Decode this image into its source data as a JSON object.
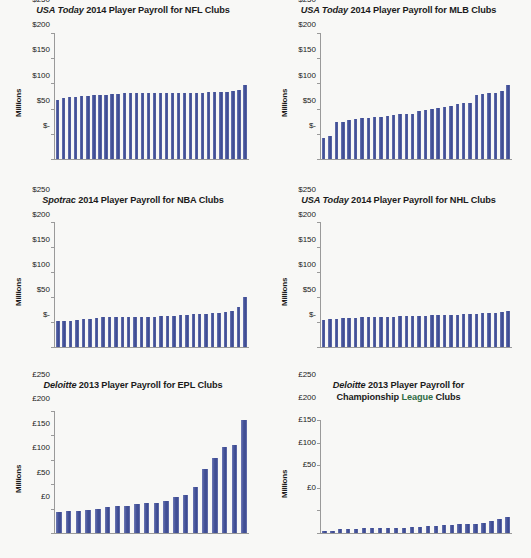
{
  "page": {
    "background": "#f8f8f6",
    "bar_color": "#4c5a9b",
    "axis_color": "#9a9a9a"
  },
  "axis_label": "Millions",
  "charts": [
    {
      "id": "nfl",
      "title_source": "USA Today",
      "title_rest": " 2014 Player Payroll for NFL Clubs",
      "title_full": "USA Today 2014 Player Payroll for NFL Clubs",
      "currency": "$",
      "ylabel": "Millions",
      "yticks": [
        "$250",
        "$200",
        "$150",
        "$100",
        "$50",
        "$-"
      ],
      "ytick_values": [
        250,
        200,
        150,
        100,
        50,
        0
      ]
    },
    {
      "id": "mlb",
      "title_source": "USA Today",
      "title_rest": " 2014 Player Payroll for MLB Clubs",
      "title_full": "USA Today 2014 Player Payroll for MLB Clubs",
      "currency": "$",
      "ylabel": "Millions",
      "yticks": [
        "$250",
        "$200",
        "$150",
        "$100",
        "$50",
        "$-"
      ],
      "ytick_values": [
        250,
        200,
        150,
        100,
        50,
        0
      ]
    },
    {
      "id": "nba",
      "title_source": "Spotrac",
      "title_rest": " 2014 Player Payroll for NBA Clubs",
      "title_full": "Spotrac 2014 Player Payroll for NBA Clubs",
      "currency": "$",
      "ylabel": "Millions",
      "yticks": [
        "$250",
        "$200",
        "$150",
        "$100",
        "$50",
        "$-"
      ],
      "ytick_values": [
        250,
        200,
        150,
        100,
        50,
        0
      ]
    },
    {
      "id": "nhl",
      "title_source": "USA Today",
      "title_rest": " 2014 Player Payroll for NHL Clubs",
      "title_full": "USA Today 2014 Player Payroll for NHL Clubs",
      "currency": "$",
      "ylabel": "Millions",
      "yticks": [
        "$250",
        "$200",
        "$150",
        "$100",
        "$50",
        "$-"
      ],
      "ytick_values": [
        250,
        200,
        150,
        100,
        50,
        0
      ]
    },
    {
      "id": "epl",
      "title_source": "Deloitte",
      "title_rest": " 2013 Player Payroll for EPL Clubs",
      "title_full": "Deloitte 2013 Player Payroll for EPL Clubs",
      "currency": "£",
      "ylabel": "Millions",
      "yticks": [
        "£250",
        "£200",
        "£150",
        "£100",
        "£50",
        "£0"
      ],
      "ytick_values": [
        250,
        200,
        150,
        100,
        50,
        0
      ]
    },
    {
      "id": "championship",
      "title_source": "Deloitte",
      "title_rest": " 2013 Player Payroll for",
      "title_line2_a": "Championship ",
      "title_line2_green": "League",
      "title_line2_b": " Clubs",
      "title_full": "Deloitte 2013 Player Payroll for Championship League Clubs",
      "currency": "£",
      "ylabel": "Millions",
      "yticks": [
        "£250",
        "£200",
        "£150",
        "£100",
        "£50",
        "£0"
      ],
      "ytick_values": [
        250,
        200,
        150,
        100,
        50,
        0
      ]
    }
  ],
  "chart_data": [
    {
      "type": "bar",
      "id": "nfl",
      "title": "USA Today 2014 Player Payroll for NFL Clubs",
      "xlabel": "",
      "ylabel": "Millions",
      "ylim": [
        0,
        250
      ],
      "ytick_values": [
        0,
        50,
        100,
        150,
        200,
        250
      ],
      "ytick_labels": [
        "$-",
        "$50",
        "$100",
        "$150",
        "$200",
        "$250"
      ],
      "grid": false,
      "legend": "none",
      "categories": [
        "1",
        "2",
        "3",
        "4",
        "5",
        "6",
        "7",
        "8",
        "9",
        "10",
        "11",
        "12",
        "13",
        "14",
        "15",
        "16",
        "17",
        "18",
        "19",
        "20",
        "21",
        "22",
        "23",
        "24",
        "25",
        "26",
        "27",
        "28",
        "29",
        "30",
        "31",
        "32"
      ],
      "values": [
        117,
        122,
        123,
        123,
        125,
        126,
        127,
        128,
        128,
        129,
        129,
        130,
        130,
        130,
        130,
        130,
        130,
        130,
        130,
        130,
        130,
        131,
        131,
        131,
        131,
        132,
        132,
        132,
        133,
        135,
        137,
        146
      ]
    },
    {
      "type": "bar",
      "id": "mlb",
      "title": "USA Today 2014 Player Payroll for MLB Clubs",
      "xlabel": "",
      "ylabel": "Millions",
      "ylim": [
        0,
        250
      ],
      "ytick_values": [
        0,
        50,
        100,
        150,
        200,
        250
      ],
      "ytick_labels": [
        "$-",
        "$50",
        "$100",
        "$150",
        "$200",
        "$250"
      ],
      "grid": false,
      "legend": "none",
      "categories": [
        "1",
        "2",
        "3",
        "4",
        "5",
        "6",
        "7",
        "8",
        "9",
        "10",
        "11",
        "12",
        "13",
        "14",
        "15",
        "16",
        "17",
        "18",
        "19",
        "20",
        "21",
        "22",
        "23",
        "24",
        "25",
        "26",
        "27",
        "28",
        "29",
        "30"
      ],
      "values": [
        42,
        45,
        73,
        74,
        77,
        79,
        81,
        82,
        83,
        83,
        86,
        88,
        89,
        89,
        89,
        96,
        98,
        99,
        102,
        104,
        105,
        110,
        112,
        112,
        127,
        129,
        130,
        131,
        135,
        147
      ]
    },
    {
      "type": "bar",
      "id": "nba",
      "title": "Spotrac 2014 Player Payroll for NBA Clubs",
      "xlabel": "",
      "ylabel": "Millions",
      "ylim": [
        0,
        250
      ],
      "ytick_values": [
        0,
        50,
        100,
        150,
        200,
        250
      ],
      "ytick_labels": [
        "$-",
        "$50",
        "$100",
        "$150",
        "$200",
        "$250"
      ],
      "grid": false,
      "legend": "none",
      "categories": [
        "1",
        "2",
        "3",
        "4",
        "5",
        "6",
        "7",
        "8",
        "9",
        "10",
        "11",
        "12",
        "13",
        "14",
        "15",
        "16",
        "17",
        "18",
        "19",
        "20",
        "21",
        "22",
        "23",
        "24",
        "25",
        "26",
        "27",
        "28",
        "29",
        "30"
      ],
      "values": [
        52,
        52,
        53,
        54,
        56,
        57,
        59,
        60,
        61,
        61,
        61,
        61,
        61,
        61,
        61,
        61,
        62,
        62,
        63,
        64,
        65,
        66,
        67,
        67,
        68,
        69,
        70,
        72,
        80,
        101
      ]
    },
    {
      "type": "bar",
      "id": "nhl",
      "title": "USA Today 2014 Player Payroll for NHL Clubs",
      "xlabel": "",
      "ylabel": "Millions",
      "ylim": [
        0,
        250
      ],
      "ytick_values": [
        0,
        50,
        100,
        150,
        200,
        250
      ],
      "ytick_labels": [
        "$-",
        "$50",
        "$100",
        "$150",
        "$200",
        "$250"
      ],
      "grid": false,
      "legend": "none",
      "categories": [
        "1",
        "2",
        "3",
        "4",
        "5",
        "6",
        "7",
        "8",
        "9",
        "10",
        "11",
        "12",
        "13",
        "14",
        "15",
        "16",
        "17",
        "18",
        "19",
        "20",
        "21",
        "22",
        "23",
        "24",
        "25",
        "26",
        "27",
        "28",
        "29",
        "30"
      ],
      "values": [
        55,
        56,
        57,
        58,
        59,
        59,
        60,
        60,
        60,
        61,
        61,
        61,
        62,
        62,
        62,
        63,
        63,
        64,
        64,
        64,
        65,
        65,
        66,
        66,
        67,
        68,
        68,
        69,
        70,
        72
      ]
    },
    {
      "type": "bar",
      "id": "epl",
      "title": "Deloitte 2013 Player Payroll for EPL Clubs",
      "xlabel": "",
      "ylabel": "Millions",
      "ylim": [
        0,
        250
      ],
      "ytick_values": [
        0,
        50,
        100,
        150,
        200,
        250
      ],
      "ytick_labels": [
        "£0",
        "£50",
        "£100",
        "£150",
        "£200",
        "£250"
      ],
      "grid": false,
      "legend": "none",
      "categories": [
        "1",
        "2",
        "3",
        "4",
        "5",
        "6",
        "7",
        "8",
        "9",
        "10",
        "11",
        "12",
        "13",
        "14",
        "15",
        "16",
        "17",
        "18",
        "19",
        "20"
      ],
      "values": [
        44,
        45,
        46,
        47,
        50,
        53,
        55,
        56,
        59,
        61,
        62,
        65,
        73,
        77,
        95,
        131,
        153,
        177,
        181,
        231
      ]
    },
    {
      "type": "bar",
      "id": "championship",
      "title": "Deloitte 2013 Player Payroll for Championship League Clubs",
      "xlabel": "",
      "ylabel": "Millions",
      "ylim": [
        0,
        250
      ],
      "ytick_values": [
        0,
        50,
        100,
        150,
        200,
        250
      ],
      "ytick_labels": [
        "£0",
        "£50",
        "£100",
        "£150",
        "£200",
        "£250"
      ],
      "grid": false,
      "legend": "none",
      "categories": [
        "1",
        "2",
        "3",
        "4",
        "5",
        "6",
        "7",
        "8",
        "9",
        "10",
        "11",
        "12",
        "13",
        "14",
        "15",
        "16",
        "17",
        "18",
        "19",
        "20",
        "21",
        "22",
        "23",
        "24"
      ],
      "values": [
        4,
        5,
        8,
        9,
        9,
        10,
        10,
        10,
        11,
        11,
        12,
        13,
        14,
        15,
        16,
        17,
        18,
        19,
        20,
        21,
        22,
        26,
        30,
        35
      ]
    }
  ]
}
